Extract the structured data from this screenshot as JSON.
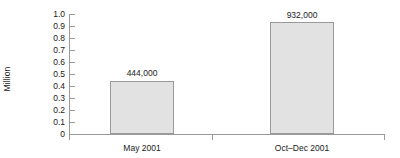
{
  "chart_data": {
    "type": "bar",
    "title": "",
    "xlabel": "",
    "ylabel": "Million",
    "categories": [
      "May 2001",
      "Oct–Dec 2001"
    ],
    "values": [
      0.444,
      0.932
    ],
    "value_labels": [
      "444,000",
      "932,000"
    ],
    "ylim": [
      0,
      1.0
    ],
    "ytick_values": [
      0,
      0.1,
      0.2,
      0.3,
      0.4,
      0.5,
      0.6,
      0.7,
      0.8,
      0.9,
      1.0
    ],
    "ytick_labels": [
      "0",
      "0.1",
      "0.2",
      "0.3",
      "0.4",
      "0.5",
      "0.6",
      "0.7",
      "0.8",
      "0.9",
      "1.0"
    ],
    "grid": false,
    "legend": null,
    "legend_position": "none",
    "colors": {
      "bar_fill": "#e2e2e2",
      "bar_border": "#9a9a9a",
      "axis": "#9a9a9a",
      "text": "#1a1a1a",
      "background": "#ffffff"
    }
  }
}
